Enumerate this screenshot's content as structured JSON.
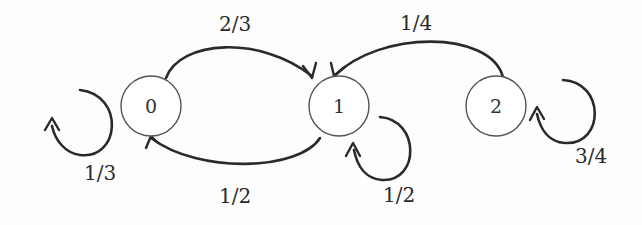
{
  "diagram": {
    "type": "markov-chain-state-diagram",
    "nodes": [
      {
        "id": "0",
        "label": "0"
      },
      {
        "id": "1",
        "label": "1"
      },
      {
        "id": "2",
        "label": "2"
      }
    ],
    "edges": [
      {
        "from": "0",
        "to": "0",
        "label": "1/3"
      },
      {
        "from": "0",
        "to": "1",
        "label": "2/3"
      },
      {
        "from": "1",
        "to": "0",
        "label": "1/2"
      },
      {
        "from": "1",
        "to": "1",
        "label": "1/2"
      },
      {
        "from": "2",
        "to": "1",
        "label": "1/4"
      },
      {
        "from": "2",
        "to": "2",
        "label": "3/4"
      }
    ]
  }
}
